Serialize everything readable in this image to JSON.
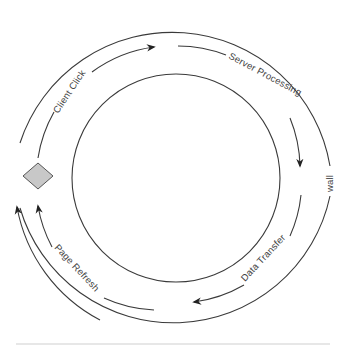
{
  "diagram": {
    "title": "",
    "center": {
      "x": 174,
      "y": 178
    },
    "radii": {
      "outer": 160,
      "middle": 134,
      "inner": 104
    },
    "colors": {
      "line": "#3a3a3a",
      "text": "#444444",
      "diamond_fill": "#c8c8c8",
      "diamond_stroke": "#555555",
      "rule": "#cccccc"
    },
    "labels": {
      "client_click": "Client Click",
      "server_processing": "Server Processing",
      "data_transfer": "Data Transfer",
      "page_refresh": "Page Refresh",
      "wall": "wall"
    },
    "steps": [
      {
        "id": "client_click",
        "label": "Client Click",
        "from": "client",
        "to": "server"
      },
      {
        "id": "server_processing",
        "label": "Server Processing",
        "from": "server",
        "to": "server"
      },
      {
        "id": "data_transfer",
        "label": "Data Transfer",
        "from": "server",
        "to": "client"
      },
      {
        "id": "page_refresh",
        "label": "Page Refresh",
        "from": "client",
        "to": "client"
      }
    ],
    "nodes": [
      {
        "id": "client",
        "shape": "diamond"
      }
    ],
    "boundary_label": "wall"
  }
}
